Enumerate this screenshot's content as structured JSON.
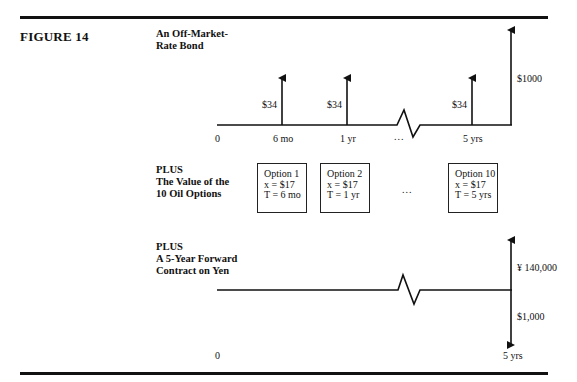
{
  "figure": {
    "label": "FIGURE 14"
  },
  "sections": {
    "bond": {
      "title_line1": "An Off-Market-",
      "title_line2": "Rate Bond",
      "timeline_labels": [
        "0",
        "6 mo",
        "1 yr",
        "...",
        "5 yrs"
      ],
      "coupon_labels": [
        "$34",
        "$34",
        "$34"
      ],
      "principal_label": "$1000"
    },
    "options": {
      "title_line1": "PLUS",
      "title_line2": "The Value of the",
      "title_line3": "10 Oil Options",
      "boxes": [
        {
          "name": "Option 1",
          "strike": "x = $17",
          "maturity": "T = 6 mo"
        },
        {
          "name": "Option 2",
          "strike": "x = $17",
          "maturity": "T = 1 yr"
        },
        {
          "name": "Option 10",
          "strike": "x = $17",
          "maturity": "T = 5 yrs"
        }
      ],
      "ellipsis": "..."
    },
    "forward": {
      "title_line1": "PLUS",
      "title_line2": "A 5-Year Forward",
      "title_line3": "Contract on Yen",
      "receive_label": "¥ 140,000",
      "pay_label": "$1,000",
      "timeline_labels": [
        "0",
        "5 yrs"
      ]
    }
  }
}
